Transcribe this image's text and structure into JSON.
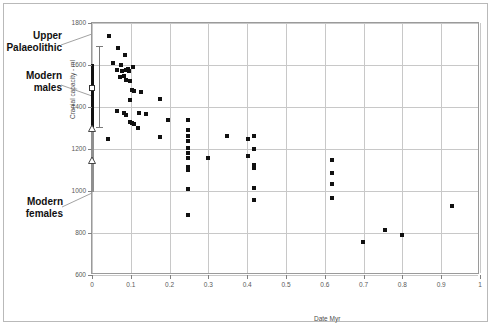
{
  "chart_data": {
    "type": "scatter",
    "title": "",
    "xlabel": "Date Myr",
    "ylabel": "Cranial capacity - ml",
    "xlim": [
      0,
      1
    ],
    "ylim": [
      600,
      1800
    ],
    "xticks": [
      "0",
      "0.1",
      "0.2",
      "0.3",
      "0.4",
      "0.5",
      "0.6",
      "0.7",
      "0.8",
      "0.9",
      "1"
    ],
    "yticks": [
      "600",
      "800",
      "1000",
      "1200",
      "1400",
      "1600",
      "1800"
    ],
    "grid": true,
    "legend_position": "none",
    "series": [
      {
        "name": "fossil hominin crania",
        "marker": "filled-square",
        "points": [
          [
            0.045,
            1740
          ],
          [
            0.068,
            1680
          ],
          [
            0.055,
            1610
          ],
          [
            0.075,
            1600
          ],
          [
            0.085,
            1650
          ],
          [
            0.065,
            1575
          ],
          [
            0.078,
            1570
          ],
          [
            0.088,
            1575
          ],
          [
            0.092,
            1580
          ],
          [
            0.095,
            1570
          ],
          [
            0.072,
            1545
          ],
          [
            0.082,
            1550
          ],
          [
            0.105,
            1590
          ],
          [
            0.088,
            1530
          ],
          [
            0.098,
            1525
          ],
          [
            0.102,
            1480
          ],
          [
            0.108,
            1478
          ],
          [
            0.125,
            1470
          ],
          [
            0.098,
            1432
          ],
          [
            0.175,
            1440
          ],
          [
            0.065,
            1380
          ],
          [
            0.082,
            1370
          ],
          [
            0.088,
            1360
          ],
          [
            0.122,
            1372
          ],
          [
            0.138,
            1368
          ],
          [
            0.098,
            1330
          ],
          [
            0.102,
            1325
          ],
          [
            0.108,
            1318
          ],
          [
            0.118,
            1300
          ],
          [
            0.195,
            1338
          ],
          [
            0.248,
            1340
          ],
          [
            0.042,
            1250
          ],
          [
            0.175,
            1255
          ],
          [
            0.248,
            1290
          ],
          [
            0.248,
            1262
          ],
          [
            0.248,
            1240
          ],
          [
            0.248,
            1205
          ],
          [
            0.248,
            1180
          ],
          [
            0.248,
            1158
          ],
          [
            0.248,
            1115
          ],
          [
            0.248,
            1100
          ],
          [
            0.248,
            1010
          ],
          [
            0.298,
            1158
          ],
          [
            0.348,
            1262
          ],
          [
            0.402,
            1248
          ],
          [
            0.418,
            1262
          ],
          [
            0.402,
            1168
          ],
          [
            0.418,
            1198
          ],
          [
            0.418,
            1122
          ],
          [
            0.418,
            1110
          ],
          [
            0.418,
            1015
          ],
          [
            0.418,
            958
          ],
          [
            0.248,
            888
          ],
          [
            0.618,
            1150
          ],
          [
            0.618,
            1088
          ],
          [
            0.618,
            1035
          ],
          [
            0.618,
            965
          ],
          [
            0.698,
            758
          ],
          [
            0.755,
            815
          ],
          [
            0.798,
            790
          ],
          [
            0.928,
            928
          ]
        ]
      }
    ],
    "reference_ranges": [
      {
        "name": "Upper Palaeolithic",
        "x": 0,
        "whisker_low": 1305,
        "whisker_high": 1690,
        "marker": "whisker"
      },
      {
        "name": "Modern males",
        "x": 0,
        "bar_low": 1300,
        "bar_high": 1605,
        "mean": 1490,
        "marker": "open-square",
        "color": "#111111"
      },
      {
        "name": "Modern females",
        "x": 0,
        "bar_low": 995,
        "bar_high": 1305,
        "mean": 1150,
        "marker": "open-triangle",
        "color": "#8f8f8f"
      }
    ],
    "annotations": [
      {
        "id": "upper-palaeolithic",
        "line1": "Upper",
        "line2": "Palaeolithic"
      },
      {
        "id": "modern-males",
        "line1": "Modern",
        "line2": "males"
      },
      {
        "id": "modern-females",
        "line1": "Modern",
        "line2": "females"
      }
    ]
  }
}
